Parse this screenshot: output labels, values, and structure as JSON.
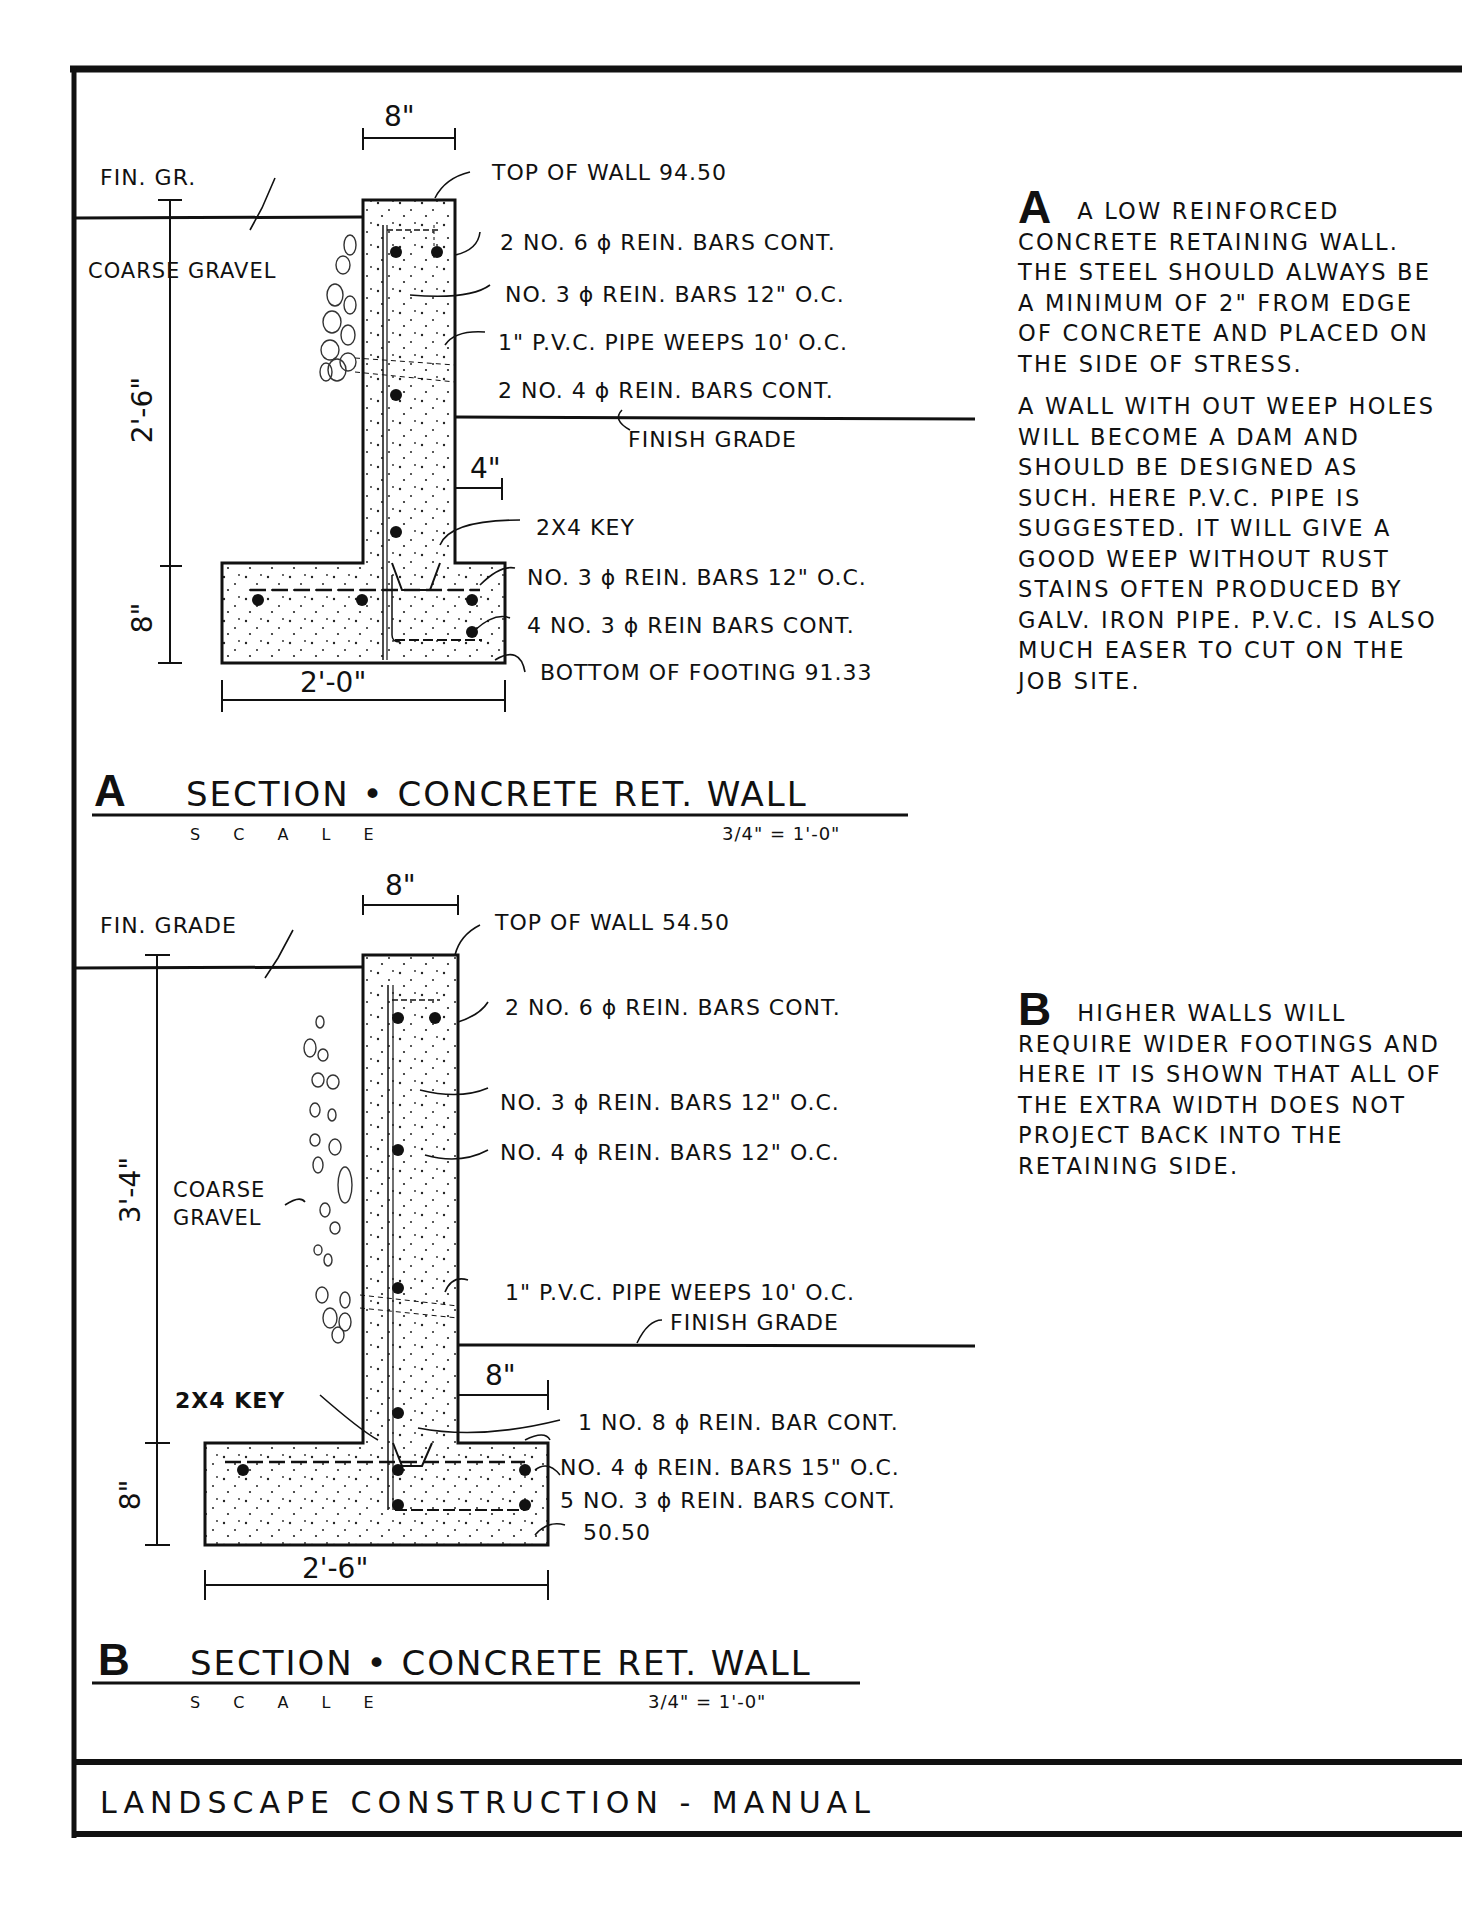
{
  "sheet": {
    "footer_title": "LANDSCAPE CONSTRUCTION - MANUAL",
    "colors": {
      "ink": "#111111",
      "paper": "#ffffff"
    }
  },
  "section_a": {
    "letter": "A",
    "title": "SECTION • CONCRETE RET. WALL",
    "scale_label": "S C A L E",
    "scale_value": "3/4\" = 1'-0\"",
    "dimensions": {
      "wall_width": "8\"",
      "toe_offset": "4\"",
      "wall_height": "2'-6\"",
      "footing_depth": "8\"",
      "footing_width": "2'-0\""
    },
    "labels": {
      "fin_grade": "FIN. GR.",
      "coarse_gravel": "COARSE GRAVEL",
      "top_of_wall": "TOP OF WALL 94.50",
      "bars_top": "2 NO. 6 ϕ REIN. BARS CONT.",
      "bars_vertical": "NO. 3 ϕ REIN. BARS 12\" O.C.",
      "weeps": "1\" P.V.C. PIPE WEEPS 10' O.C.",
      "bars_mid": "2 NO. 4 ϕ REIN. BARS CONT.",
      "finish_grade": "FINISH GRADE",
      "key": "2X4 KEY",
      "footing_bars_oc": "NO. 3 ϕ REIN. BARS 12\" O.C.",
      "footing_bars_cont": "4 NO. 3 ϕ REIN BARS CONT.",
      "bottom_of_footing": "BOTTOM OF FOOTING 91.33"
    },
    "note": {
      "letter": "A",
      "paragraphs": [
        "A low reinforced concrete retaining wall. The steel should always be a minimum of 2\" from edge of concrete and placed on the side of stress.",
        "A wall with out weep holes will become a dam and should be designed as such. Here P.V.C. pipe is suggested. It will give a good weep without rust stains often produced by galv. iron pipe. P.V.C. is also much easer to cut on the job site."
      ]
    }
  },
  "section_b": {
    "letter": "B",
    "title": "SECTION • CONCRETE RET. WALL",
    "scale_label": "S C A L E",
    "scale_value": "3/4\" = 1'-0\"",
    "dimensions": {
      "wall_width": "8\"",
      "toe_offset": "8\"",
      "wall_height": "3'-4\"",
      "footing_depth": "8\"",
      "footing_width": "2'-6\""
    },
    "labels": {
      "fin_grade": "FIN. GRADE",
      "coarse_gravel_1": "COARSE",
      "coarse_gravel_2": "GRAVEL",
      "top_of_wall": "TOP OF WALL 54.50",
      "bars_top": "2 NO. 6 ϕ REIN. BARS CONT.",
      "bars_vertical": "NO. 3 ϕ REIN. BARS 12\" O.C.",
      "bars_vertical_4": "NO. 4 ϕ REIN. BARS 12\" O.C.",
      "weeps": "1\" P.V.C. PIPE WEEPS 10' O.C.",
      "finish_grade": "FINISH GRADE",
      "key": "2X4 KEY",
      "bar_8": "1 NO. 8 ϕ REIN. BAR CONT.",
      "footing_bars_oc": "NO. 4 ϕ REIN. BARS 15\" O.C.",
      "footing_bars_cont": "5 NO. 3 ϕ REIN. BARS CONT.",
      "bottom_of_footing": "50.50"
    },
    "note": {
      "letter": "B",
      "paragraphs": [
        "Higher walls will require wider footings and here it is shown that all of the extra width does not project back into the retaining side."
      ]
    }
  }
}
